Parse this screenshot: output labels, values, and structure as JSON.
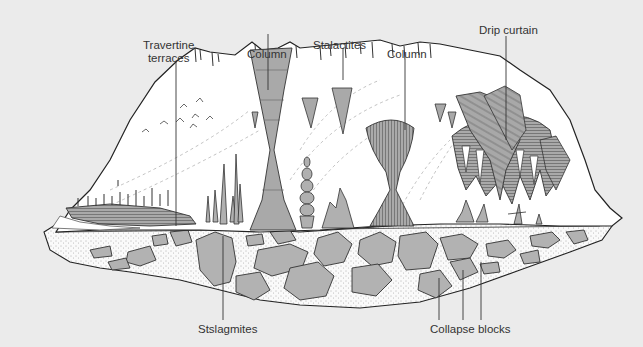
{
  "diagram": {
    "type": "cave cross-section illustration",
    "colors": {
      "background": "#ebebeb",
      "cave_fill": "#ffffff",
      "formation_gray": "#a8a8a8",
      "rock_block_gray": "#b2b2b2",
      "line": "#2a2a2a",
      "label_text": "#333333"
    },
    "labels": {
      "travertine": "Travertine\nterraces",
      "travertine_line1": "Travertine",
      "travertine_line2": "terraces",
      "column_left": "Column",
      "stalactites": "Stalactites",
      "column_right": "Column",
      "drip_curtain": "Drip curtain",
      "stalagmites": "Stslagmites",
      "collapse_blocks": "Collapse blocks"
    }
  }
}
